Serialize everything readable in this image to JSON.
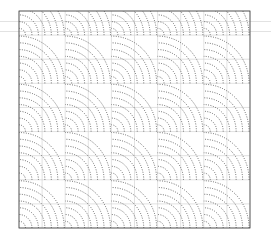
{
  "figure": {
    "title": "",
    "background_color": "#ffffff",
    "width": 271,
    "height": 244
  },
  "axes": {
    "left": 19,
    "top": 11,
    "right": 250,
    "bottom": 228,
    "border_color": "#3a3a3a",
    "border_width": 0.8,
    "grid_color": "#c9c9c9",
    "grid_on": true,
    "x_tick_labels": [],
    "y_tick_labels": [],
    "xlabel": "",
    "ylabel": ""
  },
  "stray_lines": {
    "color": "#e2e2e2",
    "y_positions": [
      21.5,
      31.5
    ],
    "x_start": 0,
    "x_end": 271
  },
  "chart_data": {
    "type": "line",
    "title": "",
    "subtitle": "",
    "xlabel": "",
    "ylabel": "",
    "grid": true,
    "legend": "none",
    "legend_entries": [],
    "annotations": [],
    "xlim": [
      0,
      10
    ],
    "ylim": [
      0,
      9
    ],
    "x_ticks": [
      0,
      1,
      2,
      3,
      4,
      5,
      6,
      7,
      8,
      9,
      10
    ],
    "y_ticks": [
      0,
      1,
      2,
      3,
      4,
      5,
      6,
      7,
      8,
      9
    ],
    "line_style": "dotted",
    "line_color": "#2b2b2b",
    "line_width": 0.75,
    "cell_width": 2,
    "cell_height": 2,
    "radii": [
      0.28,
      0.56,
      0.84,
      1.12,
      1.4,
      1.68,
      1.96
    ],
    "sources": [
      {
        "x": 0,
        "y": 0,
        "arc_start_deg": 0,
        "arc_end_deg": 90
      },
      {
        "x": 2,
        "y": 0,
        "arc_start_deg": 0,
        "arc_end_deg": 90
      },
      {
        "x": 4,
        "y": 0,
        "arc_start_deg": 0,
        "arc_end_deg": 90
      },
      {
        "x": 6,
        "y": 0,
        "arc_start_deg": 0,
        "arc_end_deg": 90
      },
      {
        "x": 8,
        "y": 0,
        "arc_start_deg": 0,
        "arc_end_deg": 90
      },
      {
        "x": 10,
        "y": 0,
        "arc_start_deg": 0,
        "arc_end_deg": 90
      },
      {
        "x": 0,
        "y": 2,
        "arc_start_deg": 0,
        "arc_end_deg": 90
      },
      {
        "x": 2,
        "y": 2,
        "arc_start_deg": 0,
        "arc_end_deg": 90
      },
      {
        "x": 4,
        "y": 2,
        "arc_start_deg": 0,
        "arc_end_deg": 90
      },
      {
        "x": 6,
        "y": 2,
        "arc_start_deg": 0,
        "arc_end_deg": 90
      },
      {
        "x": 8,
        "y": 2,
        "arc_start_deg": 0,
        "arc_end_deg": 90
      },
      {
        "x": 10,
        "y": 2,
        "arc_start_deg": 0,
        "arc_end_deg": 90
      },
      {
        "x": 0,
        "y": 4,
        "arc_start_deg": 0,
        "arc_end_deg": 90
      },
      {
        "x": 2,
        "y": 4,
        "arc_start_deg": 0,
        "arc_end_deg": 90
      },
      {
        "x": 4,
        "y": 4,
        "arc_start_deg": 0,
        "arc_end_deg": 90
      },
      {
        "x": 6,
        "y": 4,
        "arc_start_deg": 0,
        "arc_end_deg": 90
      },
      {
        "x": 8,
        "y": 4,
        "arc_start_deg": 0,
        "arc_end_deg": 90
      },
      {
        "x": 10,
        "y": 4,
        "arc_start_deg": 0,
        "arc_end_deg": 90
      },
      {
        "x": 0,
        "y": 6,
        "arc_start_deg": 0,
        "arc_end_deg": 90
      },
      {
        "x": 2,
        "y": 6,
        "arc_start_deg": 0,
        "arc_end_deg": 90
      },
      {
        "x": 4,
        "y": 6,
        "arc_start_deg": 0,
        "arc_end_deg": 90
      },
      {
        "x": 6,
        "y": 6,
        "arc_start_deg": 0,
        "arc_end_deg": 90
      },
      {
        "x": 8,
        "y": 6,
        "arc_start_deg": 0,
        "arc_end_deg": 90
      },
      {
        "x": 10,
        "y": 6,
        "arc_start_deg": 0,
        "arc_end_deg": 90
      },
      {
        "x": 0,
        "y": 8,
        "arc_start_deg": 0,
        "arc_end_deg": 90
      },
      {
        "x": 2,
        "y": 8,
        "arc_start_deg": 0,
        "arc_end_deg": 90
      },
      {
        "x": 4,
        "y": 8,
        "arc_start_deg": 0,
        "arc_end_deg": 90
      },
      {
        "x": 6,
        "y": 8,
        "arc_start_deg": 0,
        "arc_end_deg": 90
      },
      {
        "x": 8,
        "y": 8,
        "arc_start_deg": 0,
        "arc_end_deg": 90
      },
      {
        "x": 10,
        "y": 8,
        "arc_start_deg": 0,
        "arc_end_deg": 90
      }
    ]
  }
}
